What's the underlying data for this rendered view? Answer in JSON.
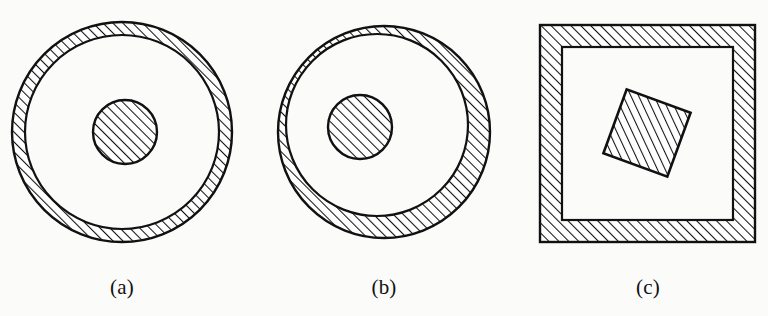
{
  "page": {
    "width": 768,
    "height": 316,
    "background_color": "#fbfbfa",
    "ink_color": "#111111"
  },
  "captions": [
    {
      "id": "a",
      "label": "(a)"
    },
    {
      "id": "b",
      "label": "(b)"
    },
    {
      "id": "c",
      "label": "(c)"
    }
  ],
  "hatching": {
    "angle_deg": 45,
    "direction": "lower-left to upper-right",
    "spacing_px": 7,
    "line_width_px": 2,
    "color": "#111111"
  },
  "figures": [
    {
      "id": "a",
      "caption": "(a)",
      "type": "concentric-annulus-with-core",
      "shapes": {
        "outer_circle": {
          "cx": 122,
          "cy": 132,
          "r": 110
        },
        "inner_boundary_circle": {
          "cx": 122,
          "cy": 132,
          "r": 97
        },
        "core_disk": {
          "cx": 125,
          "cy": 132,
          "r": 32
        }
      },
      "hatched_regions": [
        "annulus",
        "core-disk"
      ],
      "unhatched_regions": [
        "gap-between-inner-boundary-and-core"
      ],
      "note": "Annulus of uniform thickness; core disk concentric with ring"
    },
    {
      "id": "b",
      "caption": "(b)",
      "type": "eccentric-annulus-with-offset-core",
      "shapes": {
        "outer_circle": {
          "cx": 384,
          "cy": 132,
          "r": 106
        },
        "inner_boundary_circle": {
          "cx": 377,
          "cy": 125,
          "r": 91
        },
        "core_disk": {
          "cx": 360,
          "cy": 127,
          "r": 32
        }
      },
      "hatched_regions": [
        "annulus",
        "core-disk"
      ],
      "unhatched_regions": [
        "gap-between-inner-boundary-and-core"
      ],
      "note": "Inner boundary offset up-left so ring is thicker at bottom-right; core disk shifted left of centre"
    },
    {
      "id": "c",
      "caption": "(c)",
      "type": "square-frame-with-rotated-core",
      "shapes": {
        "outer_square": {
          "x": 540,
          "y": 25,
          "width": 215,
          "height": 217
        },
        "inner_boundary_square": {
          "x": 562,
          "y": 47,
          "width": 171,
          "height": 173
        },
        "core_square": {
          "cx": 647,
          "cy": 133,
          "side": 68,
          "rotation_deg": 20
        }
      },
      "hatched_regions": [
        "square-frame",
        "rotated-core-square"
      ],
      "unhatched_regions": [
        "gap-between-frame-and-core"
      ],
      "note": "Square annular frame of uniform thickness with small tilted hatched square inside, above-left of centre"
    }
  ]
}
